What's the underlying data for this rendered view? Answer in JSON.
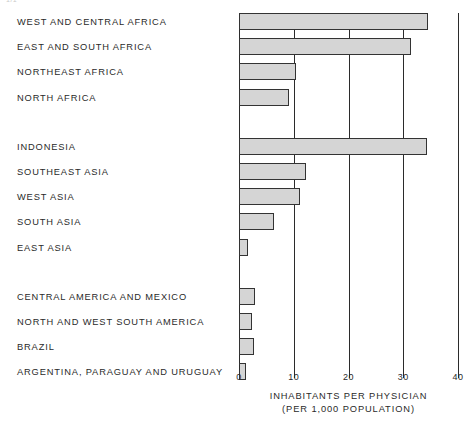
{
  "top_fragment": "1/1",
  "chart_data": {
    "type": "bar",
    "orientation": "horizontal",
    "title": "",
    "xlabel": "INHABITANTS PER PHYSICIAN",
    "xlabel_sub": "(PER 1,000 POPULATION)",
    "ylabel": "",
    "xlim": [
      0,
      40
    ],
    "xticks": [
      0,
      10,
      20,
      30,
      40
    ],
    "xtick_labels": [
      "0",
      "10",
      "20",
      "30",
      "40"
    ],
    "grid": "vertical",
    "legend": "none",
    "bar_fill": "#d5d5d5",
    "bar_edge": "#333333",
    "groups": [
      {
        "name": "Africa",
        "categories": [
          "WEST AND CENTRAL AFRICA",
          "EAST AND SOUTH AFRICA",
          "NORTHEAST AFRICA",
          "NORTH AFRICA"
        ],
        "values": [
          34.5,
          31.5,
          10.5,
          9.2
        ]
      },
      {
        "name": "Asia",
        "categories": [
          "INDONESIA",
          "SOUTHEAST ASIA",
          "WEST ASIA",
          "SOUTH ASIA",
          "EAST ASIA"
        ],
        "values": [
          34.3,
          12.3,
          11.2,
          6.4,
          1.6
        ]
      },
      {
        "name": "Latin America",
        "categories": [
          "CENTRAL AMERICA AND MEXICO",
          "NORTH AND WEST SOUTH AMERICA",
          "BRAZIL",
          "ARGENTINA, PARAGUAY AND URUGUAY"
        ],
        "values": [
          3.0,
          2.4,
          2.8,
          1.3
        ]
      }
    ],
    "categories": [
      "WEST AND CENTRAL AFRICA",
      "EAST AND SOUTH AFRICA",
      "NORTHEAST AFRICA",
      "NORTH AFRICA",
      "INDONESIA",
      "SOUTHEAST ASIA",
      "WEST ASIA",
      "SOUTH ASIA",
      "EAST ASIA",
      "CENTRAL AMERICA AND MEXICO",
      "NORTH AND WEST SOUTH AMERICA",
      "BRAZIL",
      "ARGENTINA, PARAGUAY AND URUGUAY"
    ],
    "values": [
      34.5,
      31.5,
      10.5,
      9.2,
      34.3,
      12.3,
      11.2,
      6.4,
      1.6,
      3.0,
      2.4,
      2.8,
      1.3
    ]
  }
}
